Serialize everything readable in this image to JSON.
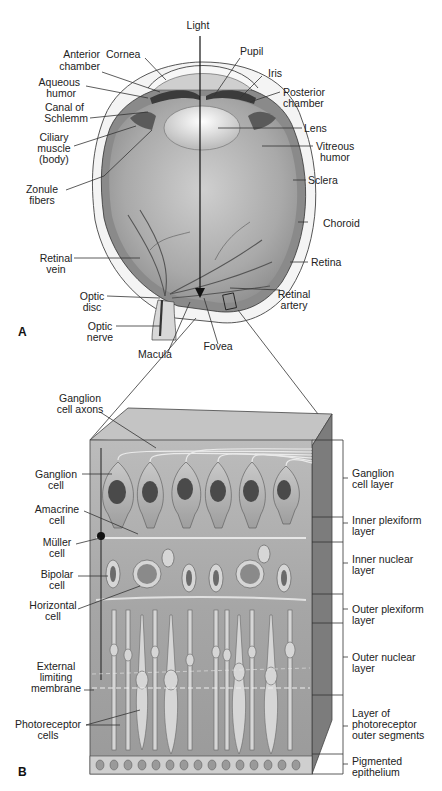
{
  "panel_a": {
    "letter": "A",
    "labels": {
      "light": "Light",
      "cornea": "Cornea",
      "anterior_chamber": [
        "Anterior",
        "chamber"
      ],
      "pupil": "Pupil",
      "iris": "Iris",
      "aqueous_humor": [
        "Aqueous",
        "humor"
      ],
      "posterior_chamber": [
        "Posterior",
        "chamber"
      ],
      "canal_of_schlemm": [
        "Canal of",
        "Schlemm"
      ],
      "lens": "Lens",
      "ciliary_muscle": [
        "Ciliary",
        "muscle",
        "(body)"
      ],
      "vitreous_humor": [
        "Vitreous",
        "humor"
      ],
      "sclera": "Sclera",
      "zonule_fibers": [
        "Zonule",
        "fibers"
      ],
      "choroid": "Choroid",
      "retinal_vein": [
        "Retinal",
        "vein"
      ],
      "retina": "Retina",
      "optic_disc": [
        "Optic",
        "disc"
      ],
      "retinal_artery": [
        "Retinal",
        "artery"
      ],
      "optic_nerve": [
        "Optic",
        "nerve"
      ],
      "macula": "Macula",
      "fovea": "Fovea"
    }
  },
  "panel_b": {
    "letter": "B",
    "left_labels": {
      "ganglion_cell_axons": [
        "Ganglion",
        "cell axons"
      ],
      "ganglion_cell": [
        "Ganglion",
        "cell"
      ],
      "amacrine_cell": [
        "Amacrine",
        "cell"
      ],
      "muller_cell": [
        "Müller",
        "cell"
      ],
      "bipolar_cell": [
        "Bipolar",
        "cell"
      ],
      "horizontal_cell": [
        "Horizontal",
        "cell"
      ],
      "external_limiting_membrane": [
        "External",
        "limiting",
        "membrane"
      ],
      "photoreceptor_cells": [
        "Photoreceptor",
        "cells"
      ]
    },
    "right_layers": [
      {
        "lines": [
          "Ganglion",
          "cell layer"
        ]
      },
      {
        "lines": [
          "Inner plexiform",
          "layer"
        ]
      },
      {
        "lines": [
          "Inner nuclear",
          "layer"
        ]
      },
      {
        "lines": [
          "Outer plexiform",
          "layer"
        ]
      },
      {
        "lines": [
          "Outer nuclear",
          "layer"
        ]
      },
      {
        "lines": [
          "Layer of",
          "photoreceptor",
          "outer segments"
        ]
      },
      {
        "lines": [
          "Pigmented",
          "epithelium"
        ]
      }
    ]
  },
  "colors": {
    "vitreous": "#9a9a9a",
    "retina_block": "#a8a8a8",
    "block_side": "#7c7c7c",
    "cell_light": "#d6d6d6",
    "nucleus": "#4a4a4a"
  }
}
